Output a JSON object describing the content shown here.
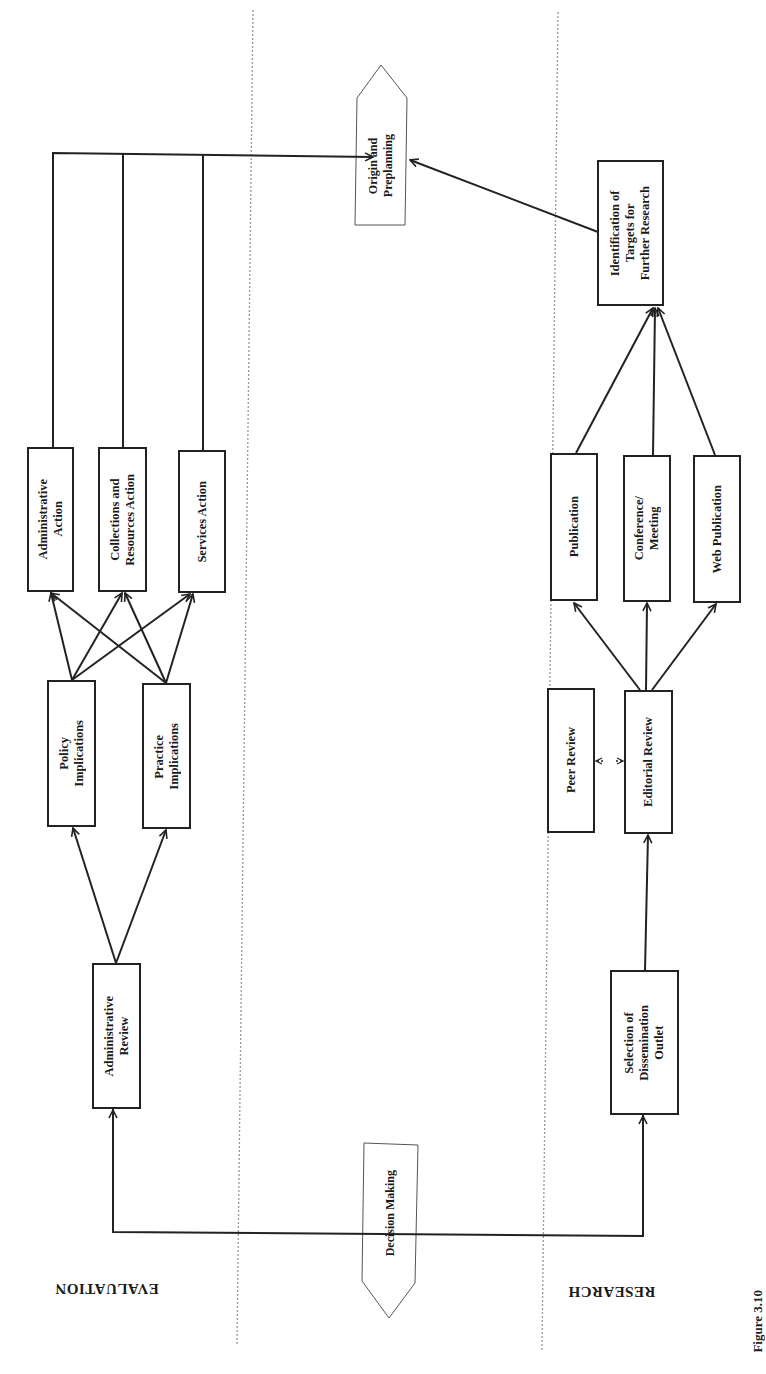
{
  "lanes": {
    "evaluation": "EVALUATION",
    "research": "RESEARCH"
  },
  "terminals": {
    "origin": "Origin and\nPreplanning",
    "decision": "Decision Making"
  },
  "evaluation": {
    "administrative_review": "Administrative\nReview",
    "policy_implications": "Policy\nImplications",
    "practice_implications": "Practice\nImplications",
    "administrative_action": "Administrative\nAction",
    "collections_action": "Collections and\nResources Action",
    "services_action": "Services Action"
  },
  "research": {
    "selection": "Selection of\nDissemination\nOutlet",
    "editorial_review": "Editorial Review",
    "peer_review": "Peer Review",
    "publication": "Publication",
    "conference": "Conference/\nMeeting",
    "web_publication": "Web Publication",
    "identification": "Identification of\nTargets for\nFurther Research"
  },
  "caption": "Figure 3.10"
}
